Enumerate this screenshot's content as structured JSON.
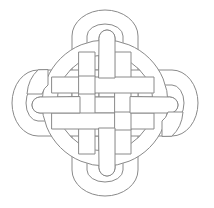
{
  "canvas": {
    "width": 214,
    "height": 208,
    "background_color": "#ffffff"
  },
  "artwork": {
    "name": "celtic-knot",
    "title": "Celtic Knot",
    "style": "line-art",
    "stroke_color": "#8a8a8a",
    "fill_color": "#ffffff",
    "stroke_width": 1,
    "center": {
      "x": 105,
      "y": 103
    },
    "bounds": {
      "left": 9,
      "top": 10,
      "right": 203,
      "bottom": 196
    },
    "band_width": 15,
    "symmetry": "4-fold"
  },
  "geometry": {
    "ring": {
      "name": "woven-circle",
      "center_x": 105,
      "center_y": 103,
      "radius_outer": 63,
      "radius_inner": 48
    },
    "lobes": [
      {
        "name": "lobe-top",
        "direction": "up",
        "tip_x": 105,
        "tip_y": 10,
        "hook_tip_x": 107,
        "hook_tip_y": 31
      },
      {
        "name": "lobe-bottom",
        "direction": "down",
        "tip_x": 105,
        "tip_y": 196,
        "hook_tip_x": 103,
        "hook_tip_y": 175
      },
      {
        "name": "lobe-left",
        "direction": "left",
        "tip_x": 9,
        "tip_y": 103,
        "hook_tip_x": 30,
        "hook_tip_y": 105
      },
      {
        "name": "lobe-right",
        "direction": "right",
        "tip_x": 203,
        "tip_y": 103,
        "hook_tip_x": 182,
        "hook_tip_y": 101
      }
    ],
    "weave_bands": [
      {
        "name": "band-vertical-left",
        "orientation": "vertical",
        "center": 87
      },
      {
        "name": "band-vertical-right",
        "orientation": "vertical",
        "center": 123
      },
      {
        "name": "band-horizontal-top",
        "orientation": "horizontal",
        "center": 85
      },
      {
        "name": "band-horizontal-bottom",
        "orientation": "horizontal",
        "center": 121
      }
    ]
  }
}
